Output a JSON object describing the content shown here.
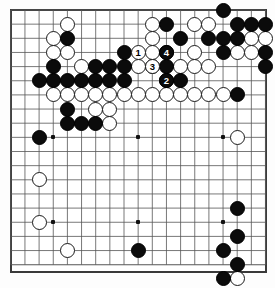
{
  "board": {
    "kind": "go-board-diagram",
    "size": 19,
    "origin_x": 10.8,
    "origin_y": 10.0,
    "spacing": 14.15,
    "line_color": "#555555",
    "border_color": "#3a3a3a",
    "background_color": "#ffffff",
    "black_color": "#0b0b0b",
    "white_color": "#ffffff",
    "star_points": [
      [
        3,
        3
      ],
      [
        9,
        3
      ],
      [
        15,
        3
      ],
      [
        3,
        9
      ],
      [
        9,
        9
      ],
      [
        15,
        9
      ],
      [
        3,
        15
      ],
      [
        9,
        15
      ],
      [
        15,
        15
      ]
    ]
  },
  "chart_data": {
    "type": "table",
    "xlabel": "column (0 = left edge line)",
    "ylabel": "row (0 = top edge line)",
    "move_count": 4,
    "black_stones": [
      [
        8,
        3
      ],
      [
        11,
        1
      ],
      [
        11,
        3
      ],
      [
        11,
        4
      ],
      [
        12,
        2
      ],
      [
        15,
        0
      ],
      [
        15,
        2
      ],
      [
        15,
        3
      ],
      [
        17,
        1
      ],
      [
        18,
        1
      ],
      [
        16,
        1
      ],
      [
        16,
        2
      ],
      [
        14,
        2
      ],
      [
        12,
        5
      ],
      [
        18,
        3
      ],
      [
        18,
        4
      ],
      [
        16,
        6
      ],
      [
        11,
        5
      ],
      [
        4,
        2
      ],
      [
        3,
        4
      ],
      [
        3,
        5
      ],
      [
        2,
        5
      ],
      [
        4,
        5
      ],
      [
        6,
        4
      ],
      [
        7,
        4
      ],
      [
        8,
        4
      ],
      [
        5,
        5
      ],
      [
        6,
        5
      ],
      [
        7,
        5
      ],
      [
        8,
        5
      ],
      [
        4,
        7
      ],
      [
        5,
        8
      ],
      [
        6,
        8
      ],
      [
        4,
        8
      ],
      [
        2,
        9
      ],
      [
        9,
        17
      ],
      [
        16,
        14
      ],
      [
        15,
        17
      ],
      [
        16,
        18
      ],
      [
        15,
        19
      ],
      [
        16,
        16
      ]
    ],
    "white_stones": [
      [
        4,
        1
      ],
      [
        3,
        2
      ],
      [
        3,
        3
      ],
      [
        10,
        1
      ],
      [
        10,
        2
      ],
      [
        10,
        3
      ],
      [
        13,
        1
      ],
      [
        14,
        1
      ],
      [
        17,
        2
      ],
      [
        16,
        3
      ],
      [
        17,
        3
      ],
      [
        18,
        2
      ],
      [
        13,
        3
      ],
      [
        12,
        4
      ],
      [
        13,
        4
      ],
      [
        14,
        4
      ],
      [
        11,
        6
      ],
      [
        12,
        6
      ],
      [
        13,
        6
      ],
      [
        14,
        6
      ],
      [
        15,
        6
      ],
      [
        10,
        6
      ],
      [
        9,
        6
      ],
      [
        10,
        4
      ],
      [
        4,
        3
      ],
      [
        5,
        4
      ],
      [
        5,
        6
      ],
      [
        6,
        6
      ],
      [
        7,
        6
      ],
      [
        8,
        6
      ],
      [
        9,
        4
      ],
      [
        3,
        6
      ],
      [
        4,
        6
      ],
      [
        6,
        7
      ],
      [
        7,
        7
      ],
      [
        7,
        8
      ],
      [
        2,
        12
      ],
      [
        2,
        15
      ],
      [
        4,
        17
      ],
      [
        16,
        9
      ],
      [
        16,
        19
      ]
    ],
    "numbered_moves": [
      {
        "label": "1",
        "color": "white",
        "col": 9,
        "row": 3
      },
      {
        "label": "2",
        "color": "black",
        "col": 11,
        "row": 5
      },
      {
        "label": "3",
        "color": "white",
        "col": 10,
        "row": 4
      },
      {
        "label": "4",
        "color": "black",
        "col": 11,
        "row": 3
      }
    ]
  }
}
